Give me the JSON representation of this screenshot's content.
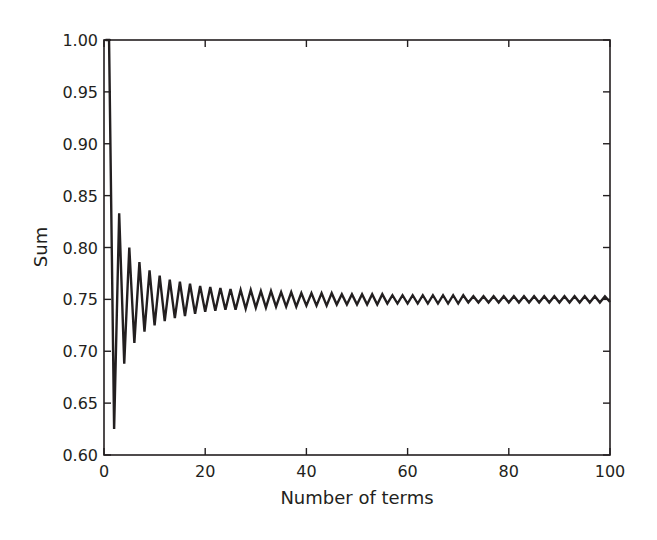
{
  "chart_data": {
    "type": "line",
    "title": "",
    "xlabel": "Number of terms",
    "ylabel": "Sum",
    "xlim": [
      0,
      100
    ],
    "ylim": [
      0.6,
      1.0
    ],
    "xticks": [
      0,
      20,
      40,
      60,
      80,
      100
    ],
    "xtick_labels": [
      "0",
      "20",
      "40",
      "60",
      "80",
      "100"
    ],
    "yticks": [
      0.6,
      0.65,
      0.7,
      0.75,
      0.8,
      0.85,
      0.9,
      0.95,
      1.0
    ],
    "ytick_labels": [
      "0.60",
      "0.65",
      "0.70",
      "0.75",
      "0.80",
      "0.85",
      "0.90",
      "0.95",
      "1.00"
    ],
    "grid": false,
    "legend": null,
    "box": true,
    "ticks_inward_all_sides": true,
    "line_color": "#231f20",
    "series": [
      {
        "name": "Partial sum",
        "x": [
          1,
          2,
          3,
          4,
          5,
          6,
          7,
          8,
          9,
          10,
          11,
          12,
          13,
          14,
          15,
          16,
          17,
          18,
          19,
          20,
          21,
          22,
          23,
          24,
          25,
          26,
          27,
          28,
          29,
          30,
          31,
          32,
          33,
          34,
          35,
          36,
          37,
          38,
          39,
          40,
          41,
          42,
          43,
          44,
          45,
          46,
          47,
          48,
          49,
          50,
          51,
          52,
          53,
          54,
          55,
          56,
          57,
          58,
          59,
          60,
          61,
          62,
          63,
          64,
          65,
          66,
          67,
          68,
          69,
          70,
          71,
          72,
          73,
          74,
          75,
          76,
          77,
          78,
          79,
          80,
          81,
          82,
          83,
          84,
          85,
          86,
          87,
          88,
          89,
          90,
          91,
          92,
          93,
          94,
          95,
          96,
          97,
          98,
          99,
          100
        ],
        "values": [
          1.0,
          0.625,
          0.833,
          0.688,
          0.8,
          0.708,
          0.786,
          0.719,
          0.778,
          0.725,
          0.773,
          0.729,
          0.769,
          0.732,
          0.767,
          0.734,
          0.765,
          0.736,
          0.763,
          0.738,
          0.762,
          0.739,
          0.761,
          0.74,
          0.76,
          0.74,
          0.759,
          0.741,
          0.759,
          0.742,
          0.758,
          0.742,
          0.758,
          0.743,
          0.757,
          0.743,
          0.757,
          0.743,
          0.756,
          0.744,
          0.756,
          0.744,
          0.756,
          0.744,
          0.756,
          0.745,
          0.755,
          0.745,
          0.755,
          0.745,
          0.755,
          0.745,
          0.755,
          0.745,
          0.755,
          0.746,
          0.754,
          0.746,
          0.754,
          0.746,
          0.754,
          0.746,
          0.754,
          0.746,
          0.754,
          0.746,
          0.754,
          0.746,
          0.754,
          0.746,
          0.754,
          0.747,
          0.753,
          0.747,
          0.753,
          0.747,
          0.753,
          0.747,
          0.753,
          0.747,
          0.753,
          0.747,
          0.753,
          0.747,
          0.753,
          0.747,
          0.753,
          0.747,
          0.753,
          0.747,
          0.753,
          0.747,
          0.753,
          0.747,
          0.753,
          0.747,
          0.753,
          0.747,
          0.753,
          0.7475
        ]
      }
    ],
    "limit_value": 0.75
  }
}
